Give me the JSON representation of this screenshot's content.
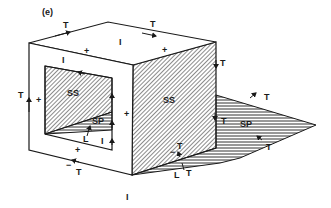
{
  "figure": {
    "panel_label": "(e)",
    "labels": {
      "top_T_left": "T",
      "top_T_right": "T",
      "top_I": "I",
      "top_plus_front": "+",
      "top_plus_right": "+",
      "front_I": "I",
      "left_T": "T",
      "left_plus": "+",
      "window_SS": "SS",
      "window_SP": "SP",
      "window_L": "L",
      "window_I": "I",
      "front_plus_right": "+",
      "front_plus_bottom": "+",
      "bottom_minus": "−",
      "bottom_T": "T",
      "right_SS": "SS",
      "right_T": "T",
      "shadow_T_top": "T",
      "shadow_T_inner": "T",
      "shadow_SP": "SP",
      "shadow_T_bottom": "T",
      "corner_T": "T",
      "corner_minus": "−",
      "corner_L": "L",
      "corner_T2": "T",
      "bottom_I": "I"
    },
    "colors": {
      "line": "#1a1a1a",
      "background": "#ffffff"
    }
  }
}
